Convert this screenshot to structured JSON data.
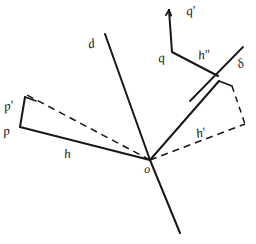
{
  "figure": {
    "background_color": "#ffffff",
    "ink_color": "#171717",
    "width": 256,
    "height": 244,
    "labels": [
      {
        "id": "d-upper",
        "text": "d",
        "x": 88,
        "y": 37,
        "size": 13,
        "rotate": -12
      },
      {
        "id": "q-prime",
        "text": "q'",
        "x": 186,
        "y": 4,
        "size": 13,
        "rotate": -8
      },
      {
        "id": "q",
        "text": "q",
        "x": 158,
        "y": 51,
        "size": 13,
        "rotate": -8
      },
      {
        "id": "h-double",
        "text": "h\"",
        "x": 198,
        "y": 48,
        "size": 13,
        "rotate": -8
      },
      {
        "id": "delta",
        "text": "δ",
        "x": 237,
        "y": 57,
        "size": 13,
        "rotate": -22
      },
      {
        "id": "p-prime",
        "text": "p'",
        "x": 4,
        "y": 99,
        "size": 13,
        "rotate": -10
      },
      {
        "id": "p",
        "text": "p",
        "x": 3,
        "y": 124,
        "size": 13,
        "rotate": -8
      },
      {
        "id": "h",
        "text": "h",
        "x": 64,
        "y": 147,
        "size": 13,
        "rotate": -6
      },
      {
        "id": "h-prime",
        "text": "h'",
        "x": 196,
        "y": 126,
        "size": 13,
        "rotate": -14
      },
      {
        "id": "origin",
        "text": "o",
        "x": 144,
        "y": 163,
        "size": 12,
        "rotate": -6
      }
    ],
    "solid_paths": [
      {
        "id": "d-axis-upper",
        "points": "105,34 150,160",
        "width": 2.0
      },
      {
        "id": "d-axis-lower",
        "points": "150,160 180,233",
        "width": 2.0
      },
      {
        "id": "h-ray",
        "points": "150,160 20,127",
        "width": 2.0
      },
      {
        "id": "p-segment",
        "points": "20,127 25,97",
        "width": 2.0
      },
      {
        "id": "p-top-stub",
        "points": "25,97 36,101",
        "width": 1.6
      },
      {
        "id": "h-prime-ray",
        "points": "150,160 219,81",
        "width": 2.0
      },
      {
        "id": "h-prime-stub",
        "points": "219,81 232,86",
        "width": 1.8
      },
      {
        "id": "q-path",
        "points": "169,10 172,52 218,76",
        "width": 2.0
      },
      {
        "id": "delta-ray",
        "points": "190,101 243,47",
        "width": 1.8
      }
    ],
    "dashed_paths": [
      {
        "id": "h-dashed-upper",
        "points": "150,160 27,95",
        "width": 1.5,
        "dash": "7 5"
      },
      {
        "id": "h-prime-dashed",
        "points": "150,160 245,124",
        "width": 1.5,
        "dash": "7 5"
      },
      {
        "id": "delta-dashed",
        "points": "232,86 245,124",
        "width": 1.5,
        "dash": "6 5"
      }
    ],
    "arrowheads": [
      {
        "id": "q-prime-arrow",
        "x": 169,
        "y": 10,
        "angle": -85,
        "size": 6
      }
    ]
  }
}
